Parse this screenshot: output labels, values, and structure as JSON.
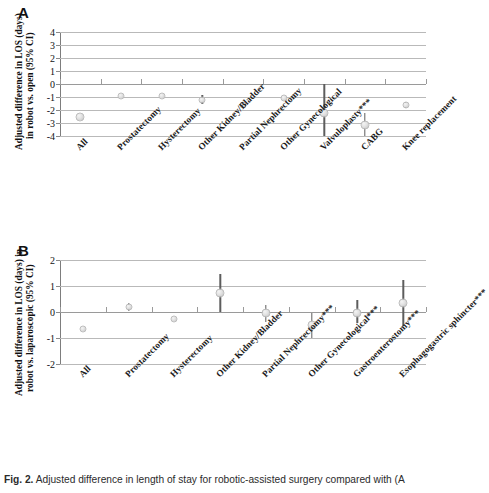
{
  "figure": {
    "caption_prefix": "Fig. 2.",
    "caption_text": "Adjusted difference in length of stay for robotic-assisted surgery compared with (A"
  },
  "panels": [
    {
      "letter": "A",
      "ylabel_line1": "Adjusted difference in LOS (days)",
      "ylabel_line2": "in robot vs. open (95% CI)"
    },
    {
      "letter": "B",
      "ylabel_line1": "Adjusted difference in LOS (days) in",
      "ylabel_line2": "robot vs. laparoscopic (95% CI)"
    }
  ],
  "chart_data": [
    {
      "type": "scatter",
      "panel": "A",
      "title": "",
      "xlabel": "",
      "ylabel": "Adjusted difference in LOS (days) in robot vs. open (95% CI)",
      "ylim": [
        -4,
        4
      ],
      "yticks": [
        "4",
        "3",
        "2",
        "1",
        "0",
        "-1",
        "-2",
        "-3",
        "-4"
      ],
      "ytick_values": [
        4,
        3,
        2,
        1,
        0,
        -1,
        -2,
        -3,
        -4
      ],
      "grid": true,
      "legend": "none",
      "categories": [
        "All",
        "Prostatectomy",
        "Hysterectomy",
        "Other Kidney/Bladder",
        "Partial Nephrectomy",
        "Other Gynecological",
        "Valvuloplasty***",
        "CABG",
        "Knee replacement"
      ],
      "values": [
        -2.5,
        -0.95,
        -0.95,
        -1.2,
        -1.6,
        -1.05,
        -2.25,
        -3.15,
        -1.6
      ],
      "ci_low": [
        -2.5,
        -1.1,
        -1.05,
        -1.55,
        -1.85,
        -1.15,
        -4.0,
        -4.0,
        -1.85
      ],
      "ci_high": [
        -2.5,
        -0.8,
        -0.85,
        -0.85,
        -1.35,
        -0.95,
        0.0,
        -2.2,
        -1.35
      ]
    },
    {
      "type": "scatter",
      "panel": "B",
      "title": "",
      "xlabel": "",
      "ylabel": "Adjusted difference in LOS (days) in robot vs. laparoscopic (95% CI)",
      "ylim": [
        -2,
        2
      ],
      "yticks": [
        "2",
        "1",
        "0",
        "-1",
        "-2"
      ],
      "ytick_values": [
        2,
        1,
        0,
        -1,
        -2
      ],
      "grid": true,
      "legend": "none",
      "categories": [
        "All",
        "Prostatectomy",
        "Hysterectomy",
        "Other Kidney/Bladder",
        "Partial Nephrectomy***",
        "Other Gynecological***",
        "Gastroenterostomy***",
        "Esophagogastric sphincter***"
      ],
      "values": [
        -0.65,
        0.2,
        -0.25,
        0.72,
        -0.05,
        -0.5,
        -0.03,
        0.33
      ],
      "ci_low": [
        -0.7,
        0.05,
        -0.3,
        0.0,
        -0.38,
        -1.0,
        -0.42,
        -0.55
      ],
      "ci_high": [
        -0.6,
        0.35,
        -0.2,
        1.48,
        0.28,
        -0.02,
        0.47,
        1.25
      ]
    }
  ]
}
